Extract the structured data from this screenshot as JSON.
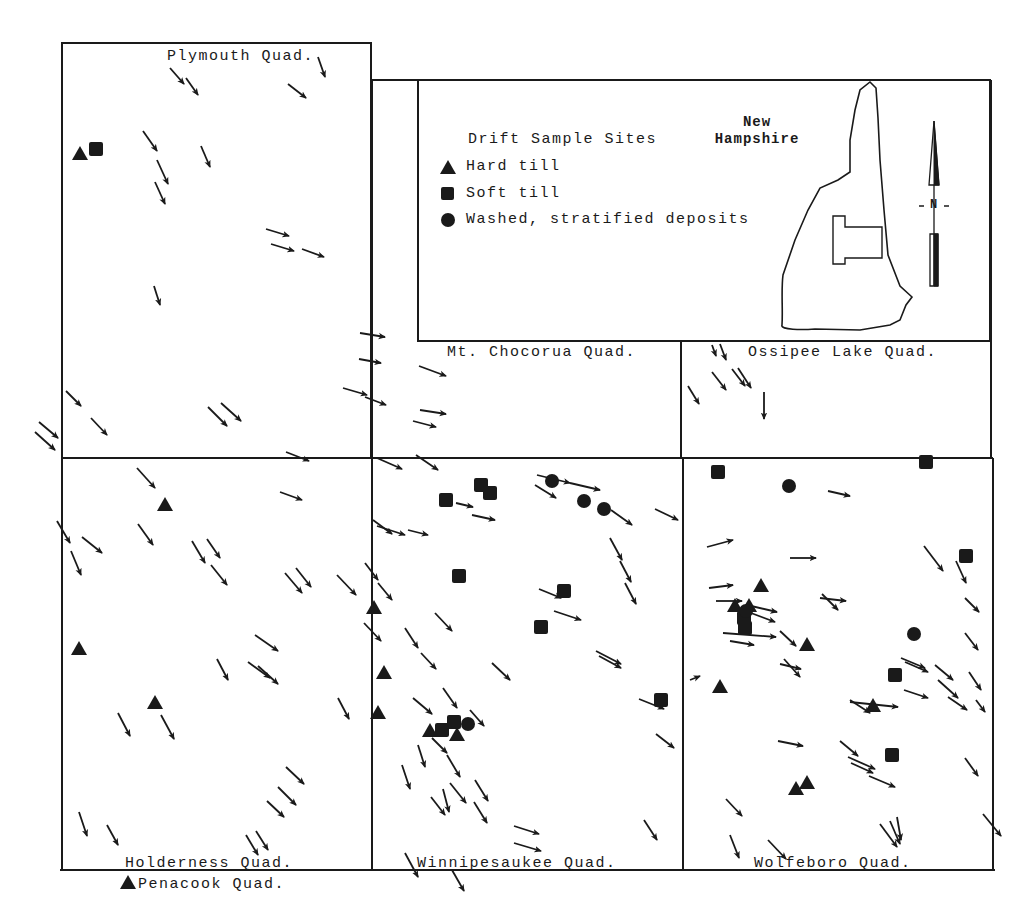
{
  "map": {
    "quadrangles": [
      {
        "name": "Plymouth Quad.",
        "box": [
          62,
          43,
          372,
          458
        ]
      },
      {
        "name": "Mt. Chocorua Quad.",
        "box": [
          372,
          340,
          681,
          458
        ]
      },
      {
        "name": "Ossipee Lake Quad.",
        "box": [
          681,
          340,
          991,
          458
        ]
      },
      {
        "name": "Holderness Quad.",
        "box": [
          62,
          458,
          372,
          870
        ]
      },
      {
        "name": "Winnipesaukee Quad.",
        "box": [
          372,
          458,
          683,
          870
        ]
      },
      {
        "name": "Wolfeboro Quad.",
        "box": [
          683,
          458,
          993,
          870
        ]
      },
      {
        "name": "Penacook Quad.",
        "box": null
      }
    ],
    "labels": {
      "plymouth": "Plymouth Quad.",
      "chocorua": "Mt. Chocorua Quad.",
      "ossipee": "Ossipee Lake Quad.",
      "holderness": "Holderness Quad.",
      "winnipesaukee": "Winnipesaukee Quad.",
      "wolfeboro": "Wolfeboro Quad.",
      "penacook": "Penacook Quad."
    },
    "inset": {
      "state_line1": "New",
      "state_line2": "Hampshire",
      "north_label": "N"
    }
  },
  "legend": {
    "title": "Drift Sample Sites",
    "items": [
      {
        "symbol": "triangle",
        "label": "Hard till"
      },
      {
        "symbol": "square",
        "label": "Soft till"
      },
      {
        "symbol": "circle",
        "label": "Washed, stratified deposits"
      }
    ]
  },
  "colors": {
    "ink": "#1a1a1a",
    "background": "#ffffff"
  },
  "sites": {
    "hard_till": [
      [
        80,
        154
      ],
      [
        165,
        505
      ],
      [
        79,
        649
      ],
      [
        155,
        703
      ],
      [
        374,
        608
      ],
      [
        384,
        673
      ],
      [
        378,
        713
      ],
      [
        430,
        731
      ],
      [
        457,
        735
      ],
      [
        761,
        586
      ],
      [
        735,
        606
      ],
      [
        749,
        606
      ],
      [
        807,
        645
      ],
      [
        720,
        687
      ],
      [
        873,
        706
      ],
      [
        796,
        789
      ],
      [
        807,
        783
      ],
      [
        128,
        883
      ]
    ],
    "soft_till": [
      [
        96,
        149
      ],
      [
        446,
        500
      ],
      [
        481,
        485
      ],
      [
        490,
        493
      ],
      [
        459,
        576
      ],
      [
        564,
        591
      ],
      [
        541,
        627
      ],
      [
        661,
        700
      ],
      [
        442,
        730
      ],
      [
        454,
        722
      ],
      [
        718,
        472
      ],
      [
        926,
        462
      ],
      [
        966,
        556
      ],
      [
        745,
        628
      ],
      [
        744,
        618
      ],
      [
        895,
        675
      ],
      [
        892,
        755
      ]
    ],
    "washed_stratified": [
      [
        552,
        481
      ],
      [
        584,
        501
      ],
      [
        604,
        509
      ],
      [
        468,
        724
      ],
      [
        789,
        486
      ],
      [
        914,
        634
      ],
      [
        746,
        611
      ]
    ]
  },
  "ice_flow_arrows": [
    [
      170,
      68,
      184,
      84
    ],
    [
      186,
      78,
      198,
      95
    ],
    [
      318,
      57,
      325,
      77
    ],
    [
      288,
      84,
      306,
      98
    ],
    [
      143,
      131,
      157,
      151
    ],
    [
      201,
      146,
      210,
      167
    ],
    [
      157,
      160,
      168,
      184
    ],
    [
      155,
      182,
      165,
      204
    ],
    [
      266,
      229,
      289,
      236
    ],
    [
      271,
      244,
      294,
      251
    ],
    [
      302,
      249,
      324,
      257
    ],
    [
      154,
      286,
      160,
      305
    ],
    [
      360,
      333,
      385,
      337
    ],
    [
      359,
      359,
      381,
      363
    ],
    [
      343,
      388,
      367,
      395
    ],
    [
      365,
      397,
      386,
      405
    ],
    [
      419,
      366,
      446,
      376
    ],
    [
      420,
      410,
      446,
      414
    ],
    [
      413,
      421,
      436,
      427
    ],
    [
      416,
      455,
      438,
      470
    ],
    [
      286,
      452,
      309,
      461
    ],
    [
      66,
      391,
      81,
      406
    ],
    [
      91,
      418,
      107,
      435
    ],
    [
      208,
      407,
      227,
      426
    ],
    [
      221,
      403,
      241,
      421
    ],
    [
      39,
      422,
      58,
      438
    ],
    [
      35,
      432,
      55,
      450
    ],
    [
      712,
      345,
      716,
      356
    ],
    [
      720,
      344,
      726,
      360
    ],
    [
      688,
      386,
      699,
      404
    ],
    [
      712,
      372,
      726,
      390
    ],
    [
      732,
      369,
      745,
      386
    ],
    [
      738,
      368,
      751,
      388
    ],
    [
      764,
      392,
      764,
      419
    ],
    [
      137,
      468,
      155,
      488
    ],
    [
      138,
      524,
      153,
      545
    ],
    [
      57,
      521,
      70,
      543
    ],
    [
      82,
      537,
      102,
      553
    ],
    [
      280,
      492,
      302,
      500
    ],
    [
      192,
      541,
      205,
      563
    ],
    [
      207,
      539,
      220,
      558
    ],
    [
      211,
      565,
      227,
      585
    ],
    [
      285,
      573,
      302,
      593
    ],
    [
      296,
      568,
      311,
      587
    ],
    [
      337,
      575,
      356,
      595
    ],
    [
      71,
      551,
      81,
      575
    ],
    [
      365,
      563,
      378,
      580
    ],
    [
      378,
      583,
      392,
      600
    ],
    [
      255,
      635,
      278,
      651
    ],
    [
      217,
      659,
      228,
      680
    ],
    [
      248,
      662,
      270,
      678
    ],
    [
      258,
      666,
      278,
      684
    ],
    [
      118,
      713,
      130,
      736
    ],
    [
      161,
      715,
      174,
      739
    ],
    [
      338,
      698,
      349,
      719
    ],
    [
      286,
      767,
      304,
      784
    ],
    [
      278,
      787,
      296,
      805
    ],
    [
      267,
      801,
      284,
      817
    ],
    [
      79,
      812,
      87,
      836
    ],
    [
      107,
      825,
      118,
      845
    ],
    [
      246,
      835,
      258,
      855
    ],
    [
      256,
      831,
      268,
      850
    ],
    [
      377,
      458,
      402,
      469
    ],
    [
      456,
      503,
      473,
      507
    ],
    [
      373,
      520,
      392,
      534
    ],
    [
      377,
      526,
      405,
      535
    ],
    [
      408,
      530,
      428,
      535
    ],
    [
      472,
      515,
      495,
      520
    ],
    [
      537,
      475,
      570,
      483
    ],
    [
      535,
      485,
      556,
      498
    ],
    [
      570,
      483,
      600,
      490
    ],
    [
      611,
      510,
      632,
      525
    ],
    [
      655,
      509,
      678,
      520
    ],
    [
      610,
      538,
      622,
      560
    ],
    [
      620,
      561,
      631,
      582
    ],
    [
      625,
      583,
      636,
      604
    ],
    [
      539,
      589,
      561,
      598
    ],
    [
      554,
      611,
      581,
      620
    ],
    [
      435,
      613,
      452,
      631
    ],
    [
      405,
      628,
      418,
      648
    ],
    [
      421,
      653,
      436,
      669
    ],
    [
      596,
      651,
      621,
      664
    ],
    [
      599,
      656,
      621,
      668
    ],
    [
      492,
      663,
      510,
      680
    ],
    [
      364,
      623,
      381,
      641
    ],
    [
      413,
      698,
      432,
      714
    ],
    [
      443,
      688,
      457,
      708
    ],
    [
      470,
      710,
      484,
      726
    ],
    [
      432,
      738,
      447,
      753
    ],
    [
      418,
      745,
      425,
      767
    ],
    [
      447,
      755,
      460,
      777
    ],
    [
      402,
      765,
      410,
      789
    ],
    [
      450,
      783,
      466,
      803
    ],
    [
      443,
      789,
      449,
      812
    ],
    [
      431,
      797,
      445,
      815
    ],
    [
      475,
      780,
      488,
      801
    ],
    [
      474,
      802,
      487,
      823
    ],
    [
      514,
      826,
      539,
      834
    ],
    [
      514,
      843,
      541,
      851
    ],
    [
      644,
      820,
      657,
      840
    ],
    [
      405,
      853,
      418,
      877
    ],
    [
      452,
      870,
      464,
      891
    ],
    [
      639,
      699,
      664,
      709
    ],
    [
      656,
      734,
      674,
      748
    ],
    [
      828,
      491,
      850,
      496
    ],
    [
      707,
      547,
      733,
      540
    ],
    [
      790,
      558,
      816,
      558
    ],
    [
      709,
      588,
      733,
      585
    ],
    [
      716,
      601,
      742,
      601
    ],
    [
      747,
      605,
      777,
      612
    ],
    [
      751,
      613,
      775,
      622
    ],
    [
      723,
      633,
      776,
      637
    ],
    [
      730,
      641,
      754,
      645
    ],
    [
      820,
      598,
      846,
      601
    ],
    [
      822,
      594,
      838,
      610
    ],
    [
      924,
      546,
      943,
      571
    ],
    [
      956,
      561,
      966,
      583
    ],
    [
      965,
      598,
      979,
      612
    ],
    [
      965,
      633,
      978,
      650
    ],
    [
      901,
      658,
      925,
      668
    ],
    [
      905,
      662,
      928,
      672
    ],
    [
      780,
      631,
      796,
      646
    ],
    [
      780,
      664,
      801,
      669
    ],
    [
      784,
      659,
      800,
      677
    ],
    [
      935,
      665,
      953,
      680
    ],
    [
      938,
      680,
      958,
      698
    ],
    [
      969,
      672,
      981,
      690
    ],
    [
      948,
      697,
      967,
      710
    ],
    [
      976,
      700,
      985,
      712
    ],
    [
      850,
      702,
      898,
      707
    ],
    [
      850,
      700,
      870,
      713
    ],
    [
      904,
      690,
      928,
      698
    ],
    [
      778,
      741,
      803,
      746
    ],
    [
      840,
      741,
      858,
      756
    ],
    [
      848,
      757,
      875,
      769
    ],
    [
      851,
      763,
      873,
      773
    ],
    [
      869,
      776,
      895,
      787
    ],
    [
      965,
      758,
      978,
      776
    ],
    [
      726,
      799,
      742,
      816
    ],
    [
      730,
      835,
      739,
      858
    ],
    [
      768,
      840,
      786,
      859
    ],
    [
      880,
      824,
      897,
      847
    ],
    [
      890,
      821,
      900,
      844
    ],
    [
      897,
      817,
      901,
      840
    ],
    [
      983,
      814,
      1001,
      836
    ],
    [
      690,
      680,
      700,
      676
    ]
  ]
}
